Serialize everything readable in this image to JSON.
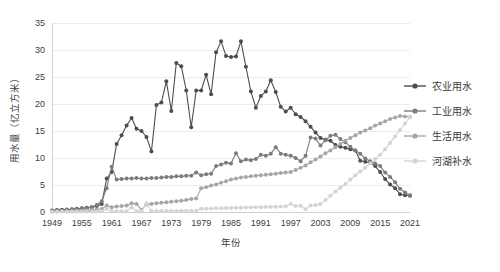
{
  "chart_data": {
    "type": "line",
    "title": "",
    "xlabel": "年份",
    "ylabel": "用水量（亿立方米）",
    "xlim": [
      1949,
      2021
    ],
    "ylim": [
      0,
      35
    ],
    "ytick_step": 5,
    "xtick_step": 6,
    "grid": true,
    "legend_position": "right",
    "xticks": [
      "1949",
      "1955",
      "1961",
      "1967",
      "1973",
      "1979",
      "1985",
      "1991",
      "1997",
      "2003",
      "2009",
      "2015",
      "2021"
    ],
    "yticks": [
      "0",
      "5",
      "10",
      "15",
      "20",
      "25",
      "30",
      "35"
    ],
    "x": [
      1949,
      1950,
      1951,
      1952,
      1953,
      1954,
      1955,
      1956,
      1957,
      1958,
      1959,
      1960,
      1961,
      1962,
      1963,
      1964,
      1965,
      1966,
      1967,
      1968,
      1969,
      1970,
      1971,
      1972,
      1973,
      1974,
      1975,
      1976,
      1977,
      1978,
      1979,
      1980,
      1981,
      1982,
      1983,
      1984,
      1985,
      1986,
      1987,
      1988,
      1989,
      1990,
      1991,
      1992,
      1993,
      1994,
      1995,
      1996,
      1997,
      1998,
      1999,
      2000,
      2001,
      2002,
      2003,
      2004,
      2005,
      2006,
      2007,
      2008,
      2009,
      2010,
      2011,
      2012,
      2013,
      2014,
      2015,
      2016,
      2017,
      2018,
      2019,
      2020,
      2021
    ],
    "series": [
      {
        "name": "农业用水",
        "color": "#4d4d4d",
        "values": [
          0.3,
          0.35,
          0.4,
          0.45,
          0.5,
          0.6,
          0.7,
          0.8,
          0.9,
          1.1,
          1.5,
          6.2,
          7.4,
          12.6,
          14.2,
          16.0,
          17.4,
          15.4,
          15.0,
          13.9,
          11.2,
          19.8,
          20.3,
          24.2,
          18.7,
          27.6,
          27.0,
          22.5,
          15.7,
          22.5,
          22.5,
          25.4,
          21.8,
          29.6,
          31.6,
          28.9,
          28.7,
          28.8,
          31.6,
          26.9,
          22.3,
          19.3,
          21.5,
          22.3,
          24.4,
          22.2,
          19.5,
          18.6,
          19.3,
          18.1,
          17.6,
          16.8,
          15.8,
          14.7,
          13.7,
          13.4,
          13.2,
          12.4,
          12.1,
          11.9,
          11.6,
          11.4,
          9.5,
          9.3,
          9.1,
          8.5,
          7.4,
          6.1,
          5.1,
          4.4,
          3.3,
          3.1,
          3.0
        ]
      },
      {
        "name": "工业用水",
        "color": "#7c7c7c",
        "values": [
          0.2,
          0.25,
          0.3,
          0.35,
          0.4,
          0.5,
          0.6,
          0.7,
          0.9,
          1.3,
          2.0,
          4.4,
          8.4,
          6.0,
          6.1,
          6.2,
          6.2,
          6.3,
          6.2,
          6.2,
          6.3,
          6.3,
          6.4,
          6.5,
          6.5,
          6.6,
          6.6,
          6.7,
          6.7,
          7.3,
          6.8,
          7.0,
          7.1,
          8.5,
          8.8,
          9.1,
          9.0,
          10.9,
          9.4,
          9.7,
          9.6,
          9.8,
          10.6,
          10.4,
          10.8,
          12.0,
          10.8,
          10.6,
          10.4,
          10.0,
          9.4,
          10.4,
          13.8,
          13.6,
          12.3,
          13.3,
          14.1,
          14.3,
          13.5,
          12.9,
          12.1,
          11.4,
          10.8,
          9.9,
          9.4,
          9.0,
          8.5,
          7.3,
          6.5,
          5.5,
          4.3,
          3.6,
          3.1
        ]
      },
      {
        "name": "生活用水",
        "color": "#a6a6a6",
        "values": [
          0.1,
          0.12,
          0.14,
          0.16,
          0.18,
          0.2,
          0.25,
          0.3,
          0.35,
          0.45,
          0.55,
          1.2,
          0.9,
          1.0,
          1.1,
          1.2,
          1.6,
          1.5,
          0.4,
          1.4,
          1.5,
          1.6,
          1.7,
          1.8,
          1.9,
          2.0,
          2.1,
          2.2,
          2.4,
          2.5,
          4.4,
          4.6,
          4.9,
          5.1,
          5.4,
          5.7,
          6.0,
          6.2,
          6.4,
          6.5,
          6.6,
          6.7,
          6.8,
          6.9,
          7.0,
          7.1,
          7.2,
          7.3,
          7.4,
          7.8,
          8.2,
          8.6,
          9.2,
          9.7,
          10.3,
          10.9,
          11.4,
          12.0,
          12.6,
          13.2,
          13.7,
          14.2,
          14.7,
          15.1,
          15.5,
          16.0,
          16.4,
          16.8,
          17.2,
          17.5,
          17.8,
          17.7,
          17.6
        ]
      },
      {
        "name": "河湖补水",
        "color": "#d4d4d4",
        "values": [
          0.05,
          0.06,
          0.07,
          0.07,
          0.08,
          0.08,
          0.09,
          0.1,
          0.1,
          0.11,
          0.12,
          0.6,
          0.13,
          0.14,
          0.14,
          0.15,
          0.9,
          0.15,
          0.16,
          1.6,
          0.17,
          0.18,
          0.18,
          0.19,
          0.2,
          0.2,
          0.21,
          0.22,
          0.22,
          0.23,
          0.6,
          0.62,
          0.65,
          0.68,
          0.7,
          0.72,
          0.75,
          0.78,
          0.8,
          0.82,
          0.85,
          0.88,
          0.9,
          0.92,
          0.95,
          0.98,
          1.0,
          1.05,
          1.5,
          1.1,
          1.15,
          0.5,
          1.2,
          1.3,
          1.5,
          2.2,
          3.0,
          3.8,
          4.5,
          5.2,
          6.0,
          6.8,
          7.5,
          8.2,
          9.0,
          9.8,
          10.6,
          11.6,
          12.8,
          14.0,
          15.2,
          16.4,
          17.6
        ]
      }
    ]
  }
}
